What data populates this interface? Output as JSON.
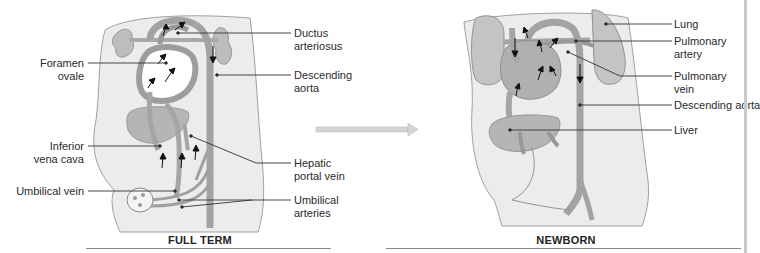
{
  "panels": [
    {
      "id": "full-term",
      "caption": "FULL TERM",
      "labels": {
        "ductus_arteriosus": [
          "Ductus",
          "arteriosus"
        ],
        "foramen_ovale": [
          "Foramen",
          "ovale"
        ],
        "descending_aorta": [
          "Descending",
          "aorta"
        ],
        "inferior_vena_cava": [
          "Inferior",
          "vena cava"
        ],
        "hepatic_portal_vein": [
          "Hepatic",
          "portal vein"
        ],
        "umbilical_vein": [
          "Umbilical vein"
        ],
        "umbilical_arteries": [
          "Umbilical",
          "arteries"
        ]
      }
    },
    {
      "id": "newborn",
      "caption": "NEWBORN",
      "labels": {
        "lung": [
          "Lung"
        ],
        "pulmonary_artery": [
          "Pulmonary",
          "artery"
        ],
        "pulmonary_vein": [
          "Pulmonary",
          "vein"
        ],
        "descending_aorta": [
          "Descending aorta"
        ],
        "liver": [
          "Liver"
        ]
      }
    }
  ],
  "transition_arrow": {
    "direction": "right",
    "meaning": "full term to newborn"
  },
  "colors": {
    "body_fill": "#ececec",
    "body_outline": "#9a9a9a",
    "vessel_fill": "#a9a9a9",
    "vessel_dark": "#8e8e8e",
    "organ_fill": "#b8b8b8",
    "lung_fill": "#c4c4c4",
    "leader_line": "#333333",
    "arrow_fill": "#d4d4d4"
  }
}
